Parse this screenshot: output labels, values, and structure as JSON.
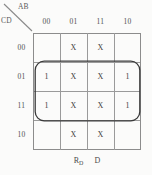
{
  "diagram": {
    "type": "karnaugh-map",
    "axis_top_label": "AB",
    "axis_left_label": "CD",
    "column_headers": [
      "00",
      "01",
      "11",
      "10"
    ],
    "row_headers": [
      "00",
      "01",
      "11",
      "10"
    ],
    "cells": [
      [
        "",
        "X",
        "X",
        ""
      ],
      [
        "1",
        "X",
        "X",
        "1"
      ],
      [
        "1",
        "X",
        "X",
        "1"
      ],
      [
        "",
        "X",
        "X",
        ""
      ]
    ],
    "caption": {
      "term_base": "R",
      "term_subscript": "D",
      "term_second": "D"
    },
    "grouping": {
      "covers_rows": [
        "01",
        "11"
      ],
      "covers_columns": [
        "00",
        "01",
        "11",
        "10"
      ]
    },
    "colors": {
      "background": "#fbfbfa",
      "grid_line": "#9a9a9a",
      "text": "#4a4a4a",
      "loop": "#3a3a3a"
    }
  }
}
